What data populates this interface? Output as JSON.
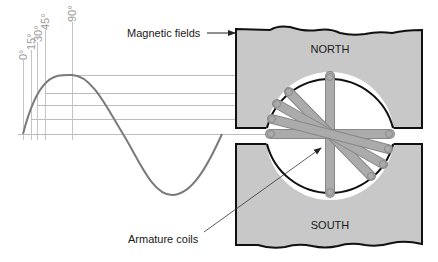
{
  "diagram": {
    "labels": {
      "magnetic_fields": "Magnetic fields",
      "armature_coils": "Armature coils",
      "north": "NORTH",
      "south": "SOUTH"
    },
    "angles": [
      {
        "label": "0°",
        "x": 23,
        "y": 134
      },
      {
        "label": "15°",
        "x": 31,
        "y": 119
      },
      {
        "label": "30°",
        "x": 37,
        "y": 105
      },
      {
        "label": "45°",
        "x": 45,
        "y": 93
      },
      {
        "label": "90°",
        "x": 72,
        "y": 75
      }
    ],
    "sine_wave": {
      "start_x": 23,
      "baseline_y": 134,
      "amplitude": 60,
      "period_px": 200
    },
    "rotor": {
      "cx": 330,
      "cy": 134,
      "r": 65
    },
    "coils": [
      {
        "angle": "0°",
        "from": [
          270,
          134
        ],
        "to": [
          390,
          134
        ]
      },
      {
        "angle": "15°",
        "from": [
          272,
          119
        ],
        "to": [
          388,
          149
        ]
      },
      {
        "angle": "30°",
        "from": [
          277,
          104
        ],
        "to": [
          383,
          164
        ]
      },
      {
        "angle": "45°",
        "from": [
          289,
          92
        ],
        "to": [
          371,
          176
        ]
      },
      {
        "angle": "90°",
        "from": [
          330,
          76
        ],
        "to": [
          330,
          193
        ]
      }
    ],
    "colors": {
      "pole_fill": "#c8c8c8",
      "coil_fill": "#a9a9a9",
      "wave": "#7a7a7a",
      "guide": "#bdbdbd",
      "outline": "#111111"
    }
  }
}
